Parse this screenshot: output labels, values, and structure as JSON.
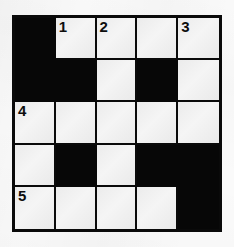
{
  "puzzle": {
    "title": "Crossword Grid",
    "rows": 5,
    "columns": 5,
    "colors": {
      "block": "#070707",
      "cell": "#eeeeee",
      "gridline": "#0a0a0a",
      "background": "#fafafa",
      "number_text": "#0d0d0d"
    },
    "grid": [
      [
        {
          "type": "block",
          "number": ""
        },
        {
          "type": "cell",
          "number": "1"
        },
        {
          "type": "cell",
          "number": "2"
        },
        {
          "type": "cell",
          "number": ""
        },
        {
          "type": "cell",
          "number": "3"
        }
      ],
      [
        {
          "type": "block",
          "number": ""
        },
        {
          "type": "block",
          "number": ""
        },
        {
          "type": "cell",
          "number": ""
        },
        {
          "type": "block",
          "number": ""
        },
        {
          "type": "cell",
          "number": ""
        }
      ],
      [
        {
          "type": "cell",
          "number": "4"
        },
        {
          "type": "cell",
          "number": ""
        },
        {
          "type": "cell",
          "number": ""
        },
        {
          "type": "cell",
          "number": ""
        },
        {
          "type": "cell",
          "number": ""
        }
      ],
      [
        {
          "type": "cell",
          "number": ""
        },
        {
          "type": "block",
          "number": ""
        },
        {
          "type": "cell",
          "number": ""
        },
        {
          "type": "block",
          "number": ""
        },
        {
          "type": "block",
          "number": ""
        }
      ],
      [
        {
          "type": "cell",
          "number": "5"
        },
        {
          "type": "cell",
          "number": ""
        },
        {
          "type": "cell",
          "number": ""
        },
        {
          "type": "cell",
          "number": ""
        },
        {
          "type": "block",
          "number": ""
        }
      ]
    ],
    "clue_numbers": [
      "1",
      "2",
      "3",
      "4",
      "5"
    ]
  }
}
